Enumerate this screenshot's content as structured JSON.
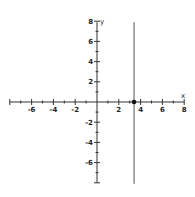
{
  "chart_data": {
    "type": "line",
    "title": "",
    "xlabel": "x",
    "ylabel": "y",
    "xlim": [
      -8,
      8
    ],
    "ylim": [
      -8,
      8
    ],
    "grid": false,
    "x_ticks": [
      -6,
      -4,
      -2,
      2,
      4,
      6,
      8
    ],
    "y_ticks": [
      8,
      6,
      4,
      2,
      -2,
      -4,
      -6
    ],
    "x_tick_labels": [
      "-6",
      "-4",
      "-2",
      "2",
      "4",
      "6",
      "8"
    ],
    "y_tick_labels": [
      "8",
      "6",
      "4",
      "2",
      "-2",
      "-4",
      "-6"
    ],
    "minor_tick_step": 1,
    "series": [
      {
        "name": "vertical line x = 3.4",
        "kind": "vertical-line",
        "x": 3.4,
        "color": "#555555"
      }
    ],
    "points": [
      {
        "name": "x-intercept",
        "x": 3.4,
        "y": 0,
        "color": "#111111"
      }
    ]
  }
}
